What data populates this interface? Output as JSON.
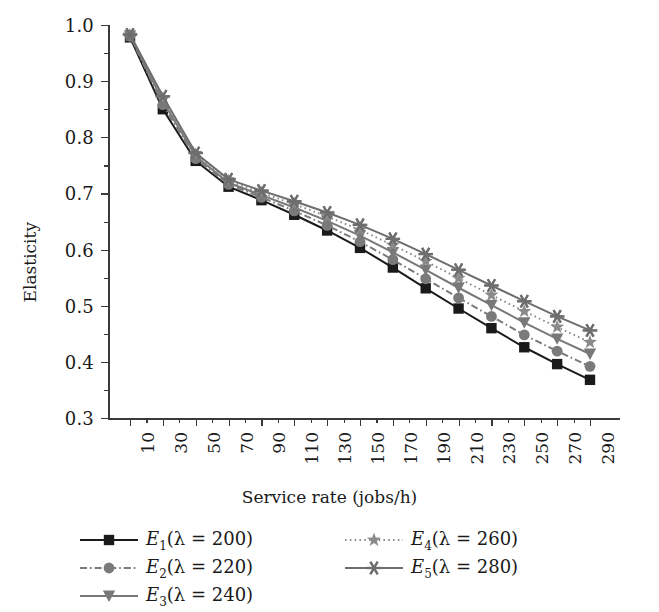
{
  "chart_data": {
    "type": "line",
    "title": "",
    "xlabel": "Service rate (jobs/h)",
    "ylabel": "Elasticity",
    "categories": [
      10,
      30,
      50,
      70,
      90,
      110,
      130,
      150,
      170,
      190,
      210,
      230,
      250,
      270,
      290
    ],
    "ylim": [
      0.3,
      1.0
    ],
    "ytick_labels": [
      "0.3",
      "0.4",
      "0.5",
      "0.6",
      "0.7",
      "0.8",
      "0.9",
      "1.0"
    ],
    "ytick_values": [
      0.3,
      0.4,
      0.5,
      0.6,
      0.7,
      0.8,
      0.9,
      1.0
    ],
    "yminor_step": 0.05,
    "grid": false,
    "legend_position": "below",
    "series": [
      {
        "name": "E1",
        "label": "E₁(λ = 200)",
        "label_base": "E",
        "label_sub": "1",
        "label_rest": "(λ = 200)",
        "marker": "square",
        "linestyle": "solid",
        "color": "#1a1a1a",
        "values": [
          0.978,
          0.85,
          0.758,
          0.712,
          0.688,
          0.662,
          0.634,
          0.603,
          0.568,
          0.531,
          0.495,
          0.46,
          0.426,
          0.396,
          0.368
        ]
      },
      {
        "name": "E2",
        "label": "E₂(λ = 220)",
        "label_base": "E",
        "label_sub": "2",
        "label_rest": "(λ = 220)",
        "marker": "circle",
        "linestyle": "dashdot",
        "color": "#7a7a7a",
        "values": [
          0.98,
          0.858,
          0.762,
          0.716,
          0.693,
          0.669,
          0.643,
          0.614,
          0.582,
          0.548,
          0.514,
          0.481,
          0.448,
          0.419,
          0.392
        ]
      },
      {
        "name": "E3",
        "label": "E₃(λ = 240)",
        "label_base": "E",
        "label_sub": "3",
        "label_rest": "(λ = 240)",
        "marker": "triangle",
        "linestyle": "solid",
        "color": "#787878",
        "values": [
          0.981,
          0.864,
          0.766,
          0.719,
          0.697,
          0.675,
          0.651,
          0.625,
          0.595,
          0.564,
          0.532,
          0.501,
          0.47,
          0.441,
          0.414
        ]
      },
      {
        "name": "E4",
        "label": "E₄(λ = 260)",
        "label_base": "E",
        "label_sub": "4",
        "label_rest": "(λ = 260)",
        "marker": "star",
        "linestyle": "dotted",
        "color": "#8a8a8a",
        "values": [
          0.982,
          0.869,
          0.769,
          0.722,
          0.701,
          0.681,
          0.659,
          0.635,
          0.608,
          0.579,
          0.549,
          0.519,
          0.49,
          0.462,
          0.435
        ]
      },
      {
        "name": "E5",
        "label": "E₅(λ = 280)",
        "label_base": "E",
        "label_sub": "5",
        "label_rest": "(λ = 280)",
        "marker": "asterisk",
        "linestyle": "solid",
        "color": "#6e6e6e",
        "values": [
          0.983,
          0.873,
          0.772,
          0.725,
          0.705,
          0.686,
          0.666,
          0.644,
          0.619,
          0.592,
          0.564,
          0.536,
          0.508,
          0.481,
          0.456
        ]
      }
    ]
  }
}
